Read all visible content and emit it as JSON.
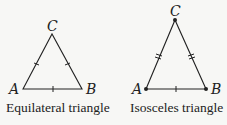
{
  "figures": [
    {
      "name": "equilateral",
      "caption": "Equilateral triangle",
      "vertices": {
        "A": "A",
        "B": "B",
        "C": "C"
      }
    },
    {
      "name": "isosceles",
      "caption": "Isosceles triangle",
      "vertices": {
        "A": "A",
        "B": "B",
        "C": "C"
      }
    }
  ],
  "colors": {
    "stroke": "#222222",
    "background": "#f7f7f5"
  }
}
